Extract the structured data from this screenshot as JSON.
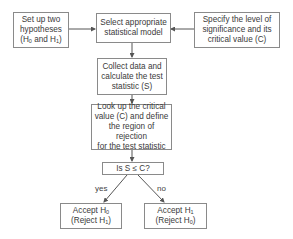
{
  "nodes": {
    "hypotheses": {
      "line1": "Set up two",
      "line2": "hypotheses",
      "line3_pre": "(H",
      "line3_sub0": "0",
      "line3_mid": " and H",
      "line3_sub1": "1",
      "line3_post": ")"
    },
    "model": {
      "line1": "Select appropriate",
      "line2": "statistical model"
    },
    "significance": {
      "line1": "Specify the level of",
      "line2": "significance and its",
      "line3": "critical value (C)"
    },
    "collect": {
      "line1": "Collect data and",
      "line2": "calculate the test",
      "line3": "statistic (S)"
    },
    "lookup": {
      "line1": "Look up the critical",
      "line2": "value (C) and define",
      "line3": "the region of rejection",
      "line4": "for the test statistic"
    },
    "decision": {
      "label": "Is S ≤ C?"
    },
    "accept_h0": {
      "line1_pre": "Accept H",
      "line1_sub": "0",
      "line2_pre": "(Reject H",
      "line2_sub": "1",
      "line2_post": ")"
    },
    "accept_h1": {
      "line1_pre": "Accept H",
      "line1_sub": "1",
      "line2_pre": "(Reject H",
      "line2_sub": "0",
      "line2_post": ")"
    }
  },
  "edges": {
    "yes_label": "yes",
    "no_label": "no"
  },
  "colors": {
    "border": "#8a8a8a",
    "line": "#555555",
    "text": "#3a3a3a"
  }
}
